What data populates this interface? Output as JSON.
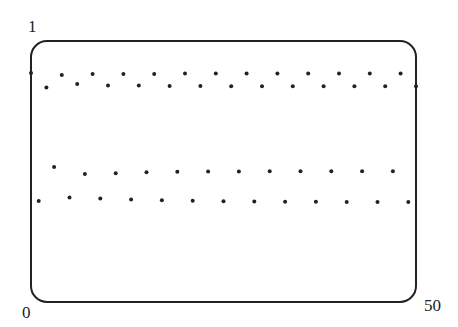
{
  "chart_data": {
    "type": "scatter",
    "title": "",
    "xlabel": "",
    "ylabel": "",
    "xlim": [
      0,
      50
    ],
    "ylim": [
      0,
      1
    ],
    "grid": false,
    "legend": null,
    "tick_labels": {
      "y_top": "1",
      "y_bottom": "0",
      "x_right": "50"
    },
    "series": [
      {
        "name": "orbit",
        "x": [
          0,
          1,
          2,
          3,
          4,
          5,
          6,
          7,
          8,
          9,
          10,
          11,
          12,
          13,
          14,
          15,
          16,
          17,
          18,
          19,
          20,
          21,
          22,
          23,
          24,
          25,
          26,
          27,
          28,
          29,
          30,
          31,
          32,
          33,
          34,
          35,
          36,
          37,
          38,
          39,
          40,
          41,
          42,
          43,
          44,
          45,
          46,
          47,
          48,
          49,
          50
        ],
        "y": [
          0.877,
          0.387,
          0.822,
          0.517,
          0.87,
          0.4,
          0.835,
          0.49,
          0.873,
          0.397,
          0.829,
          0.493,
          0.874,
          0.393,
          0.83,
          0.497,
          0.874,
          0.39,
          0.828,
          0.499,
          0.875,
          0.388,
          0.828,
          0.5,
          0.875,
          0.386,
          0.827,
          0.5,
          0.875,
          0.385,
          0.827,
          0.501,
          0.875,
          0.384,
          0.827,
          0.501,
          0.875,
          0.384,
          0.827,
          0.501,
          0.875,
          0.383,
          0.827,
          0.501,
          0.875,
          0.383,
          0.827,
          0.501,
          0.875,
          0.383,
          0.827
        ]
      }
    ]
  },
  "colors": {
    "frame": "#222222",
    "marker": "#222222",
    "background": "#ffffff"
  }
}
